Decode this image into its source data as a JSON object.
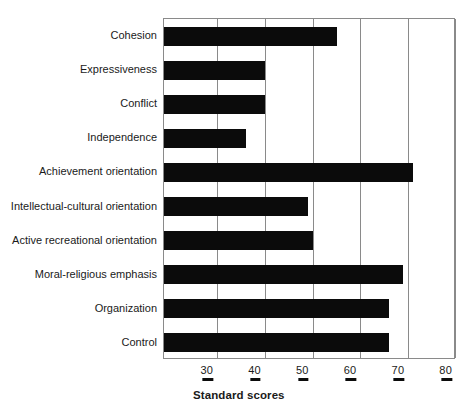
{
  "chart_data": {
    "type": "bar",
    "orientation": "horizontal",
    "title": "",
    "xlabel": "Standard scores",
    "ylabel": "",
    "xlim": [
      18.9,
      80
    ],
    "xticks": [
      30,
      40,
      50,
      60,
      70,
      80
    ],
    "grid": "vertical-only",
    "legend": "none",
    "bar_color": "#0b0b0b",
    "categories": [
      "Cohesion",
      "Expressiveness",
      "Conflict",
      "Independence",
      "Achievement orientation",
      "Intellectual-cultural orientation",
      "Active recreational orientation",
      "Moral-religious emphasis",
      "Organization",
      "Control"
    ],
    "values": [
      55,
      40,
      40,
      36,
      71,
      49,
      50,
      69,
      66,
      66
    ]
  },
  "axis": {
    "title": "Standard scores",
    "ticks": [
      {
        "label": "30",
        "value": 30
      },
      {
        "label": "40",
        "value": 40
      },
      {
        "label": "50",
        "value": 50
      },
      {
        "label": "60",
        "value": 60
      },
      {
        "label": "70",
        "value": 70
      },
      {
        "label": "80",
        "value": 80
      }
    ]
  }
}
